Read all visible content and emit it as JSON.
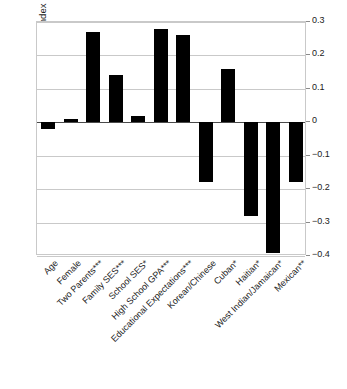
{
  "chart_data": {
    "type": "bar",
    "title": "",
    "subtitle": "",
    "xlabel": "",
    "ylabel": "Net Gain or Loss in the Downward Assimilation Index",
    "ylim": [
      -0.4,
      0.3
    ],
    "yticks": [
      0.3,
      0.2,
      0.1,
      0,
      -0.1,
      -0.2,
      -0.3,
      -0.4
    ],
    "ytick_labels": [
      "0.3",
      "0.2",
      "0.1",
      "0",
      "−0.1",
      "−0.2",
      "−0.3",
      "−0.4"
    ],
    "grid": true,
    "legend": "none",
    "y_axis_position": "right",
    "bar_color": "#000000",
    "categories": [
      "Age",
      "Female",
      "Two Parents***",
      "Family SES***",
      "School SES*",
      "High School GPA***",
      "Educational Expectations***",
      "Korean/Chinese",
      "Cuban*",
      "Haitian*",
      "West Indian/Jamaican*",
      "Mexican**"
    ],
    "values": [
      -0.02,
      0.01,
      0.27,
      0.14,
      0.02,
      0.28,
      0.26,
      -0.18,
      0.16,
      -0.28,
      -0.39,
      -0.18
    ]
  }
}
